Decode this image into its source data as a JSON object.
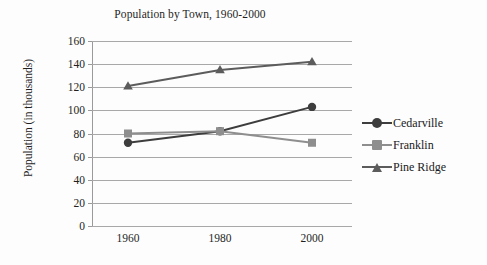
{
  "chart_data": {
    "type": "line",
    "title": "Population by Town, 1960-2000",
    "xlabel": "",
    "ylabel": "Population (in thousands)",
    "categories": [
      "1960",
      "1980",
      "2000"
    ],
    "ylim": [
      0,
      160
    ],
    "yticks": [
      "0",
      "20",
      "40",
      "60",
      "80",
      "100",
      "120",
      "140",
      "160"
    ],
    "grid": true,
    "legend_position": "right",
    "series": [
      {
        "name": "Cedarville",
        "values": [
          72,
          82,
          103
        ],
        "color": "#3d3d3d",
        "marker": "circle"
      },
      {
        "name": "Franklin",
        "values": [
          80,
          82,
          72
        ],
        "color": "#8e8e8e",
        "marker": "square"
      },
      {
        "name": "Pine Ridge",
        "values": [
          121,
          135,
          142
        ],
        "color": "#5c5c5c",
        "marker": "triangle"
      }
    ]
  },
  "axis": {
    "grid_color": "#a8a8a8",
    "axis_color": "#9a9a9a"
  }
}
